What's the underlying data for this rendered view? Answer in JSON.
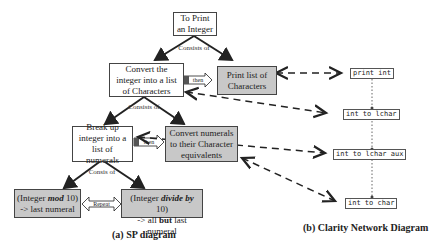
{
  "sp_diagram": {
    "caption": "(a) SP diagram",
    "root": "To Print an Integer",
    "consists_1": "Consists of",
    "convert_list": "Convert the integer into a list of Characters",
    "print_list": "Print list of Characters",
    "then_1": "then",
    "consists_2": "Consists of",
    "break_up": "Break up integer into a list of numerals",
    "convert_numerals": "Convert numerals to their Character equivalents",
    "then_2": "then",
    "consists_3": "Consis of",
    "mod_part1": "(Integer ",
    "mod_bold": "mod",
    "mod_part2": " 10)",
    "mod_line2": "-> last numeral",
    "repeat": "Repeat",
    "div_part1": "(Integer ",
    "div_bold": "divide by",
    "div_part2": " 10)",
    "div_line2_a": "-> all ",
    "div_line2_bold": "but",
    "div_line2_b": " last numeral"
  },
  "clarity_diagram": {
    "caption": "(b) Clarity Network Diagram",
    "nodes": [
      "print int",
      "int to lchar",
      "int to lchar aux",
      "int to char"
    ]
  }
}
